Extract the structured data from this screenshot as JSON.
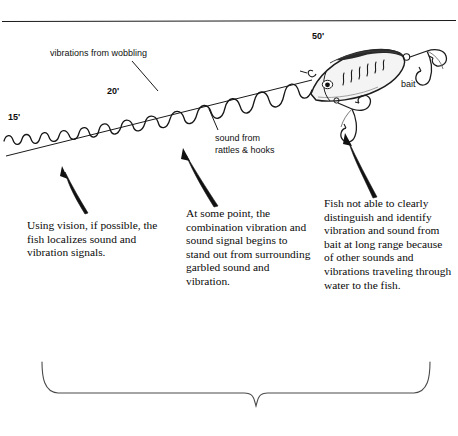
{
  "figure": {
    "type": "illustrated-diagram",
    "background_color": "#ffffff",
    "ink_color": "#111111"
  },
  "top_rule": {
    "name": "horizontal-divider"
  },
  "distance_markers": [
    {
      "id": "d15",
      "label": "15'",
      "x": 8,
      "y": 112
    },
    {
      "id": "d20",
      "label": "20'",
      "x": 107,
      "y": 86
    },
    {
      "id": "d50",
      "label": "50'",
      "x": 312,
      "y": 31
    }
  ],
  "callouts": {
    "vibrations": {
      "label": "vibrations from wobbling",
      "x": 50,
      "y": 48
    },
    "sound": {
      "line1": "sound from",
      "line2": "rattles & hooks",
      "x": 215,
      "y": 133
    },
    "bait": {
      "label": "bait",
      "x": 401,
      "y": 79
    }
  },
  "captions": [
    {
      "id": "caption-left",
      "name": "caption-vision",
      "text": "    Using vision, if possible, the fish localizes sound and vibration signals.",
      "lines": [
        "    Using vision, if",
        "possible, the fish",
        "localizes sound and",
        "vibration signals."
      ]
    },
    {
      "id": "caption-middle",
      "name": "caption-combination-signal",
      "text": "    At some point, the combination vibration and sound signal begins to stand out from surrounding garbled sound and vibration.",
      "lines": [
        "    At some point, the",
        "combination vibra-",
        "tion and sound",
        "signal begins to stand",
        "out from surround-",
        "ing garbled sound",
        "and vibration."
      ]
    },
    {
      "id": "caption-right",
      "name": "caption-long-range",
      "text": "    Fish not able to clearly distinguish and identify vibration and sound from bait at long range because of other sounds and vibrations traveling through water to the fish.",
      "lines": [
        "    Fish not able to",
        "clearly distinguish",
        "and identify vibration",
        "and sound from bait",
        "at long range because",
        "of other sounds and",
        "vibrations traveling",
        "through water to the",
        "fish."
      ]
    }
  ],
  "graphics": {
    "wave_line": "vibration-wave",
    "straight_line": "sound-ray",
    "lure": "crankbait-lure-illustration",
    "arrows": [
      "arrow-to-vision-zone",
      "arrow-to-midrange-zone",
      "arrow-to-bait-zone"
    ],
    "bottom_brace": "summary-brace"
  }
}
